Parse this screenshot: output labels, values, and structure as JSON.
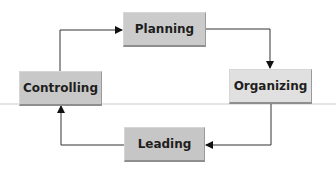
{
  "diagram": {
    "type": "cycle",
    "nodes": [
      {
        "id": "planning",
        "label": "Planning",
        "color": "#cbcbcb"
      },
      {
        "id": "organizing",
        "label": "Organizing",
        "color": "#e0e0e0"
      },
      {
        "id": "leading",
        "label": "Leading",
        "color": "#c6c6c6"
      },
      {
        "id": "controlling",
        "label": "Controlling",
        "color": "#c8c8c8"
      }
    ],
    "edges": [
      {
        "from": "planning",
        "to": "organizing"
      },
      {
        "from": "organizing",
        "to": "leading"
      },
      {
        "from": "leading",
        "to": "controlling"
      },
      {
        "from": "controlling",
        "to": "planning"
      }
    ],
    "line_color": "#2a2a2a"
  }
}
